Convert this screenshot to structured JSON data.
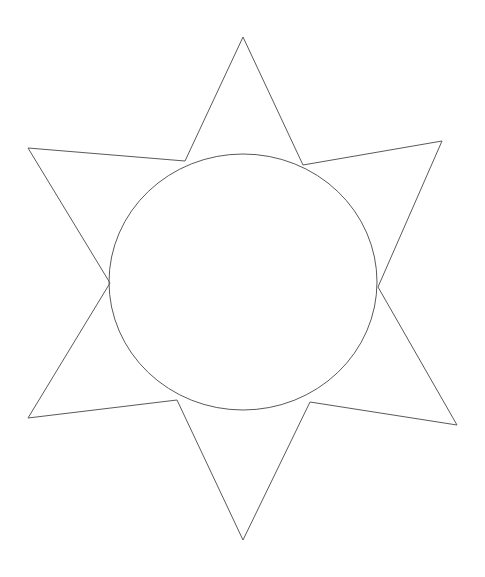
{
  "page": {
    "width": 485,
    "height": 577,
    "background_color": "#ffffff",
    "kind": "black-and-white line drawing"
  },
  "drawing": {
    "description": "Outline drawing of a six-pointed star overlapping a circle, drawn with thin dark gray lines on a white background.",
    "stroke_color": "#5a5a5a",
    "stroke_width": 1,
    "fill": "none",
    "shapes": [
      {
        "name": "six-pointed-star",
        "type": "polygon",
        "points_label": "12 alternating outer tips and inner vertices",
        "outer_tips": [
          {
            "label": "top",
            "x": 243,
            "y": 37
          },
          {
            "label": "upper-right",
            "x": 442,
            "y": 141
          },
          {
            "label": "lower-right",
            "x": 457,
            "y": 425
          },
          {
            "label": "bottom",
            "x": 243,
            "y": 540
          },
          {
            "label": "lower-left",
            "x": 28,
            "y": 418
          },
          {
            "label": "upper-left",
            "x": 28,
            "y": 148
          }
        ],
        "inner_vertices": [
          {
            "label": "upper-right-inner",
            "x": 303,
            "y": 165
          },
          {
            "label": "right-inner",
            "x": 378,
            "y": 287
          },
          {
            "label": "lower-right-inner",
            "x": 310,
            "y": 402
          },
          {
            "label": "lower-left-inner",
            "x": 177,
            "y": 400
          },
          {
            "label": "left-inner",
            "x": 110,
            "y": 283
          },
          {
            "label": "upper-left-inner",
            "x": 185,
            "y": 161
          }
        ],
        "path": "M 243 37 L 303 165 L 442 141 L 378 287 L 457 425 L 310 402 L 243 540 L 177 400 L 28 418 L 110 283 L 28 148 L 185 161 Z"
      },
      {
        "name": "inscribed-circle",
        "type": "ellipse",
        "center_x": 243,
        "center_y": 282,
        "radius_x": 134,
        "radius_y": 128,
        "bounds": {
          "left": 109,
          "right": 377,
          "top": 154,
          "bottom": 410
        }
      }
    ]
  }
}
